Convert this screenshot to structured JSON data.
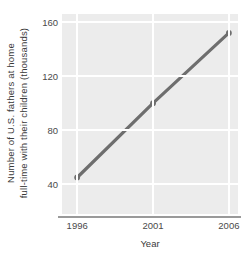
{
  "chart_data": {
    "type": "line",
    "title": "",
    "xlabel": "Year",
    "ylabel_line1": "Number of U.S. fathers at home",
    "ylabel_line2": "full-time with their children (thousands)",
    "x": [
      1996,
      2001,
      2006
    ],
    "values": [
      45,
      100,
      152
    ],
    "xticklabels": [
      "1996",
      "2001",
      "2006"
    ],
    "yticklabels": [
      "40",
      "80",
      "120",
      "160"
    ],
    "yticks": [
      40,
      80,
      120,
      160
    ],
    "xlim": [
      1995.0,
      2006.6
    ],
    "ylim": [
      18,
      166
    ],
    "grid": "major-both-white",
    "legend": "none",
    "series": [
      {
        "name": "U.S. stay-at-home fathers",
        "x": [
          1996,
          2001,
          2006
        ],
        "values": [
          45,
          100,
          152
        ],
        "line_color": "#6e6e6e",
        "marker": "circle",
        "marker_color": "#6e6e6e"
      }
    ],
    "plot_background": "#ececec",
    "gridline_color": "#ffffff",
    "axis_color": "#9a9a9a"
  }
}
